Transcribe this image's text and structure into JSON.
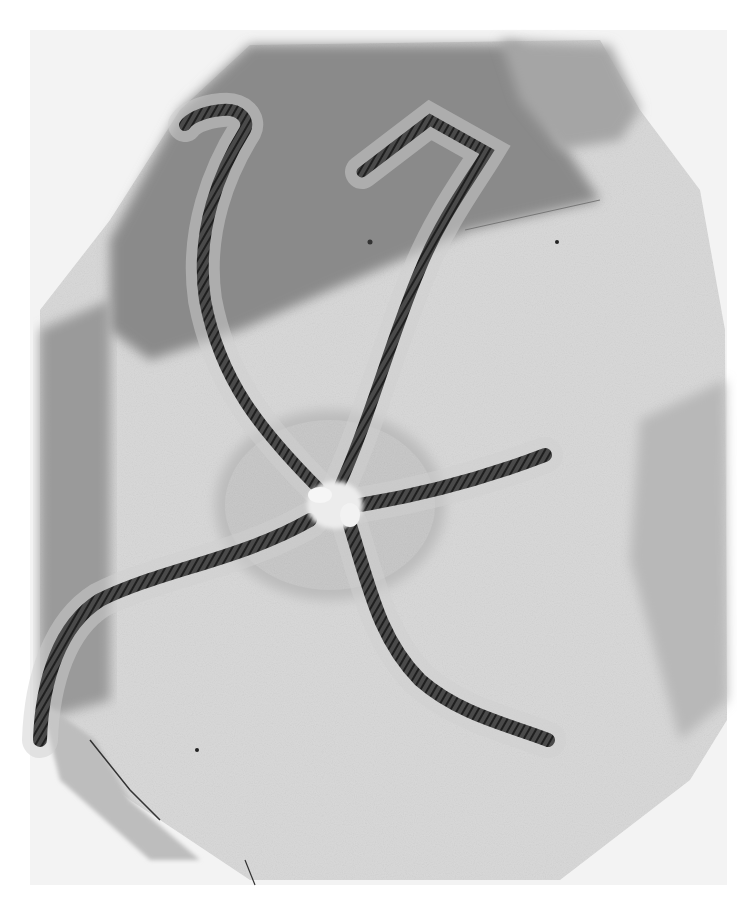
{
  "image": {
    "subject": "Fossil brittle star (ophiuroid) on a rock slab",
    "description": "Grayscale photograph of a five-armed brittle star with long spiny arms preserved on a fractured, layered stone slab",
    "colors": {
      "background": "#ffffff",
      "frame": "#f2f2f2",
      "slab_dark": "#8c8c8c",
      "slab_mid": "#b4b4b4",
      "slab_light": "#dedede",
      "arm": "#3a3a3a",
      "disc": "#c8c8c8",
      "center": "#ececec"
    },
    "arms": [
      {
        "name": "upper-left arm",
        "curl": "hooked at tip near top-left"
      },
      {
        "name": "upper-right arm",
        "curl": "bent at right angle at top"
      },
      {
        "name": "right arm",
        "curl": "straight, pointing right"
      },
      {
        "name": "lower-right arm",
        "curl": "curving down to lower right"
      },
      {
        "name": "lower-left arm",
        "curl": "long sweep to bottom-left edge"
      }
    ]
  }
}
